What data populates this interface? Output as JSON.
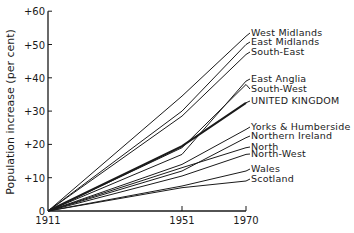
{
  "chart_data": {
    "type": "line",
    "title": "",
    "xlabel": "",
    "ylabel": "Population increase (per cent)",
    "x": [
      1911,
      1951,
      1970
    ],
    "x_tick_labels": [
      "1911",
      "1951",
      "1970"
    ],
    "y_ticks": [
      0,
      10,
      20,
      30,
      40,
      50,
      60
    ],
    "y_tick_labels": [
      "0",
      "+10",
      "+20",
      "+30",
      "+40",
      "+50",
      "+60"
    ],
    "ylim": [
      0,
      60
    ],
    "grid": false,
    "legend_position": "inline-right",
    "series": [
      {
        "name": "West Midlands",
        "values": [
          0,
          34.5,
          52.5
        ],
        "bold": false
      },
      {
        "name": "East Midlands",
        "values": [
          0,
          30,
          50
        ],
        "bold": false
      },
      {
        "name": "South-East",
        "values": [
          0,
          28.5,
          47
        ],
        "bold": false
      },
      {
        "name": "East Anglia",
        "values": [
          0,
          17,
          39
        ],
        "bold": false
      },
      {
        "name": "South-West",
        "values": [
          0,
          19,
          38
        ],
        "bold": false
      },
      {
        "name": "UNITED KINGDOM",
        "values": [
          0,
          19.5,
          32.5
        ],
        "bold": true
      },
      {
        "name": "Yorks & Humberside",
        "values": [
          0,
          14,
          24.5
        ],
        "bold": false
      },
      {
        "name": "Northern Ireland",
        "values": [
          0,
          12,
          22
        ],
        "bold": false
      },
      {
        "name": "North",
        "values": [
          0,
          13,
          19
        ],
        "bold": false
      },
      {
        "name": "North-West",
        "values": [
          0,
          10.5,
          17
        ],
        "bold": false
      },
      {
        "name": "Wales",
        "values": [
          0,
          7.5,
          12
        ],
        "bold": false
      },
      {
        "name": "Scotland",
        "values": [
          0,
          7,
          9
        ],
        "bold": false
      }
    ],
    "label_y": [
      36,
      45,
      55,
      82,
      92,
      104,
      130,
      139,
      150,
      157,
      172,
      182
    ]
  }
}
